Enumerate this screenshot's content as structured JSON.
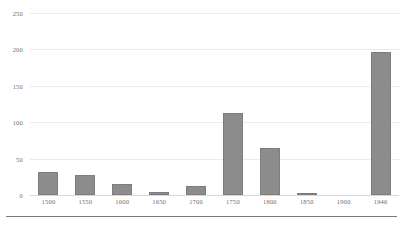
{
  "chart_data": {
    "type": "bar",
    "title": "",
    "xlabel": "",
    "ylabel": "",
    "categories": [
      "1500",
      "1550",
      "1600",
      "1650",
      "1700",
      "1750",
      "1800",
      "1850",
      "1900",
      "1946"
    ],
    "values": [
      32,
      27,
      15,
      4,
      12,
      113,
      64,
      2,
      0,
      196
    ],
    "ylim": [
      0,
      250
    ],
    "yticks": [
      "0",
      "50",
      "100",
      "150",
      "200",
      "250"
    ],
    "ytick_values": [
      0,
      50,
      100,
      150,
      200,
      250
    ],
    "grid": true,
    "legend": false,
    "bar_color": "#8c8c8c",
    "gridline_color": "#eceaea",
    "axis_color": "#7a7777",
    "text_color": "#6e6b6b"
  }
}
